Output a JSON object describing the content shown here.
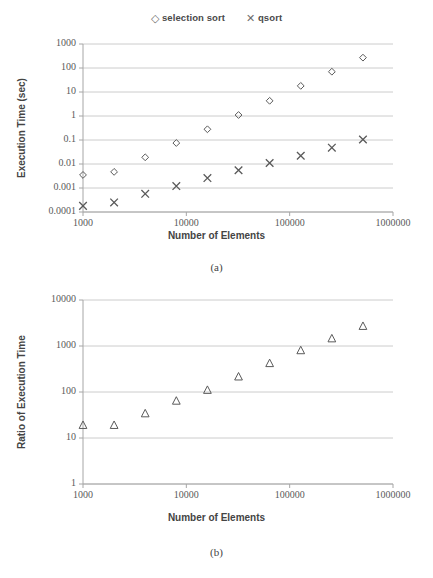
{
  "figure_a": {
    "caption": "(a)",
    "legend": [
      {
        "marker": "diamond",
        "glyph": "◇",
        "label": "selection sort"
      },
      {
        "marker": "cross",
        "glyph": "✕",
        "label": "qsort"
      }
    ],
    "xlabel": "Number of Elements",
    "ylabel": "Execution Time (sec)"
  },
  "figure_b": {
    "caption": "(b)",
    "xlabel": "Number of Elements",
    "ylabel": "Ratio of Execution Time"
  },
  "chart_data": [
    {
      "id": "a",
      "type": "scatter",
      "title": "",
      "xlabel": "Number of Elements",
      "ylabel": "Execution Time (sec)",
      "xscale": "log",
      "yscale": "log",
      "xlim": [
        1000,
        1000000
      ],
      "ylim": [
        0.0001,
        1000
      ],
      "xticks": [
        1000,
        10000,
        100000,
        1000000
      ],
      "xtick_labels": [
        "1000",
        "10000",
        "100000",
        "1000000"
      ],
      "yticks": [
        0.0001,
        0.001,
        0.01,
        0.1,
        1,
        10,
        100,
        1000
      ],
      "ytick_labels": [
        "0.0001",
        "0.001",
        "0.01",
        "0.1",
        "1",
        "10",
        "100",
        "1000"
      ],
      "grid": "horizontal",
      "legend_position": "top-center",
      "x": [
        1000,
        2000,
        4000,
        8000,
        16000,
        32000,
        64000,
        128000,
        256000,
        512000
      ],
      "series": [
        {
          "name": "selection sort",
          "marker": "diamond",
          "values": [
            0.0035,
            0.0047,
            0.019,
            0.075,
            0.28,
            1.1,
            4.3,
            18,
            70,
            270
          ]
        },
        {
          "name": "qsort",
          "marker": "cross",
          "values": [
            0.00018,
            0.00025,
            0.00057,
            0.0012,
            0.0026,
            0.0055,
            0.011,
            0.022,
            0.048,
            0.105
          ]
        }
      ]
    },
    {
      "id": "b",
      "type": "scatter",
      "title": "",
      "xlabel": "Number of Elements",
      "ylabel": "Ratio of Execution Time",
      "xscale": "log",
      "yscale": "log",
      "xlim": [
        1000,
        1000000
      ],
      "ylim": [
        1,
        10000
      ],
      "xticks": [
        1000,
        10000,
        100000,
        1000000
      ],
      "xtick_labels": [
        "1000",
        "10000",
        "100000",
        "1000000"
      ],
      "yticks": [
        1,
        10,
        100,
        1000,
        10000
      ],
      "ytick_labels": [
        "1",
        "10",
        "100",
        "1000",
        "10000"
      ],
      "grid": "horizontal",
      "legend_position": "none",
      "x": [
        1000,
        2000,
        4000,
        8000,
        16000,
        32000,
        64000,
        128000,
        256000,
        512000
      ],
      "series": [
        {
          "name": "ratio",
          "marker": "triangle",
          "values": [
            19,
            19,
            34,
            64,
            110,
            215,
            420,
            800,
            1450,
            2700
          ]
        }
      ]
    }
  ],
  "style": {
    "grid_color": "#bfbfbf",
    "axis_color": "#a6a6a6",
    "marker_color": "#5a5a5a",
    "text_color": "#4a4a4a",
    "background": "#ffffff"
  }
}
